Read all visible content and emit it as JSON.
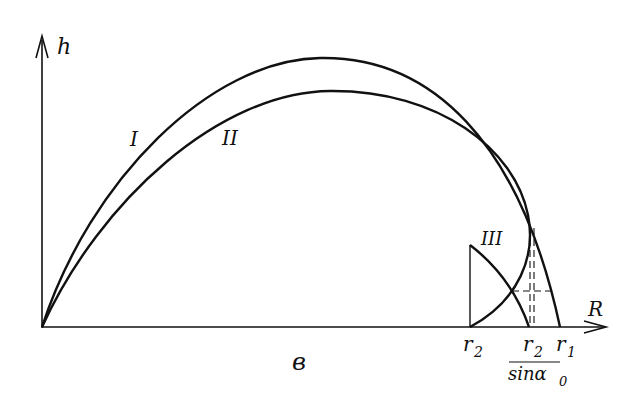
{
  "diagram": {
    "axes": {
      "y_label": "h",
      "x_label": "R"
    },
    "curves": [
      {
        "id": "I",
        "label": "I"
      },
      {
        "id": "II",
        "label": "II"
      },
      {
        "id": "III",
        "label": "III"
      }
    ],
    "x_axis_marks": {
      "b": "в",
      "r2": "r",
      "r2_sub": "2",
      "r2_over_sin_num": "r",
      "r2_over_sin_num_sub": "2",
      "r2_over_sin_den": "sinα",
      "r2_over_sin_den_sub": "0",
      "r1": "r",
      "r1_sub": "1"
    },
    "colors": {
      "line": "#111111",
      "background": "#ffffff"
    }
  }
}
